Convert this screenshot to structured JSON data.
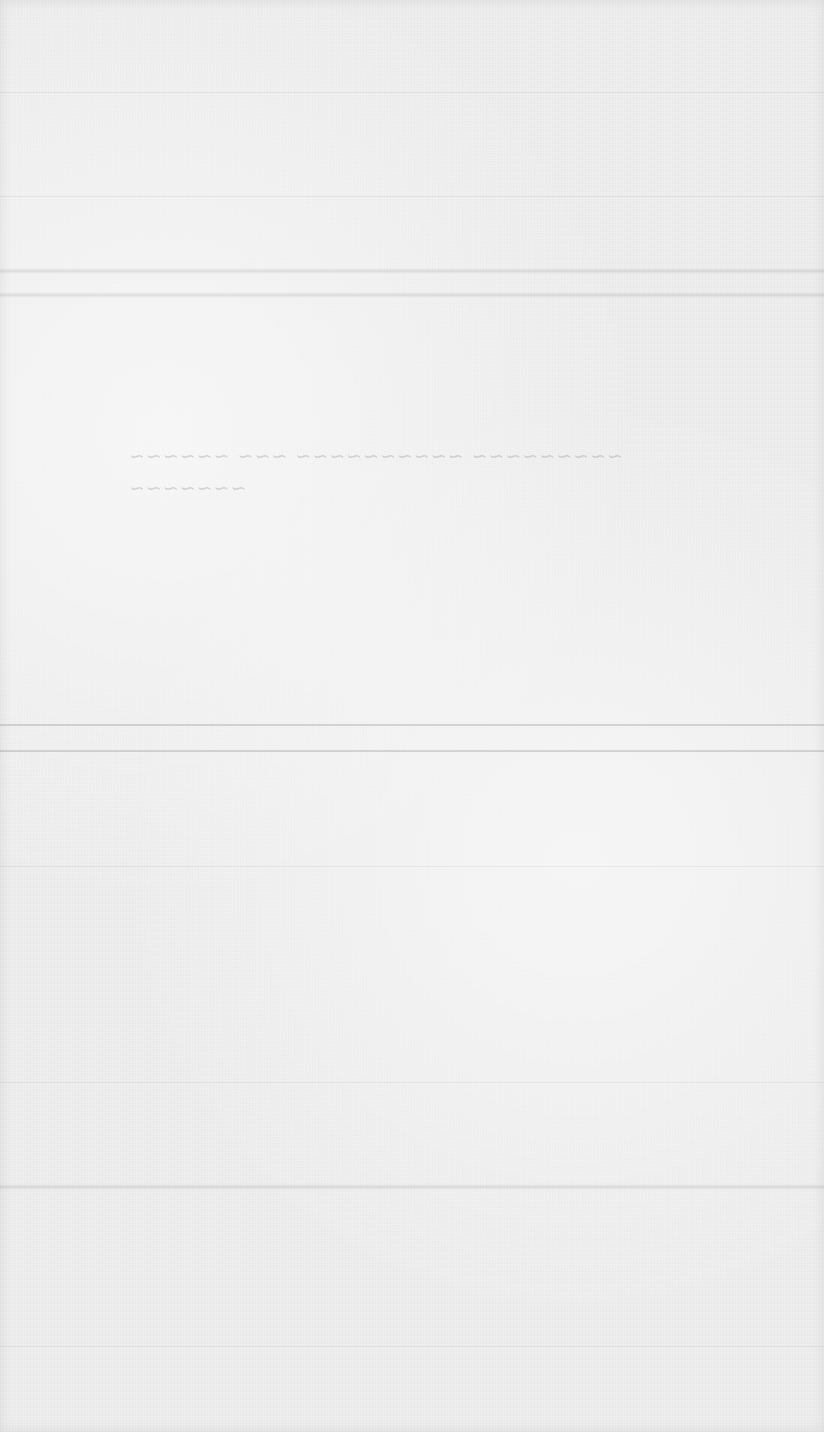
{
  "page": {
    "type": "blank scanned paper",
    "background_color": "#efefef",
    "bleed_through_text": [
      "~~~~~~~~~ ~~~~~~~~~~ ~~~ ~~~~~~",
      "~~~~~~~"
    ]
  }
}
